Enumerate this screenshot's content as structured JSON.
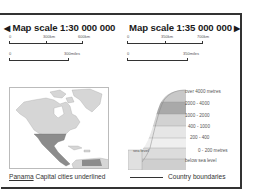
{
  "left_scale": {
    "title": "Map scale 1:30 000 000",
    "arrow": "◀",
    "km_ticks": [
      "0",
      "300km",
      "600km"
    ],
    "mile_ticks": [
      "0",
      "300miles"
    ]
  },
  "right_scale": {
    "title": "Map scale 1:35 000 000",
    "arrow": "▶",
    "km_ticks": [
      "0",
      "350km",
      "700km"
    ],
    "mile_ticks": [
      "0",
      "350miles"
    ]
  },
  "map": {
    "region": "North and Central America",
    "highlight_color": "#8c8c8c",
    "land_color": "#d6d6d6"
  },
  "elevation_legend": {
    "sea_level_label": "sea level",
    "bands": [
      {
        "label": "over 4000 metres",
        "color": "#c8c8c8"
      },
      {
        "label": "2000 - 4000",
        "color": "#a9a9a9"
      },
      {
        "label": "1000 - 2000",
        "color": "#d2d2d2"
      },
      {
        "label": "400 - 1000",
        "color": "#e6e6e6"
      },
      {
        "label": "200 - 400",
        "color": "#efefef"
      },
      {
        "label": "0 - 200 metres",
        "color": "#dcdcdc"
      },
      {
        "label": "below sea level",
        "color": "#cfcfcf"
      }
    ]
  },
  "footer": {
    "capital_example": "Panama",
    "capital_note": "Capital cities underlined",
    "boundary_note": "Country boundaries"
  }
}
